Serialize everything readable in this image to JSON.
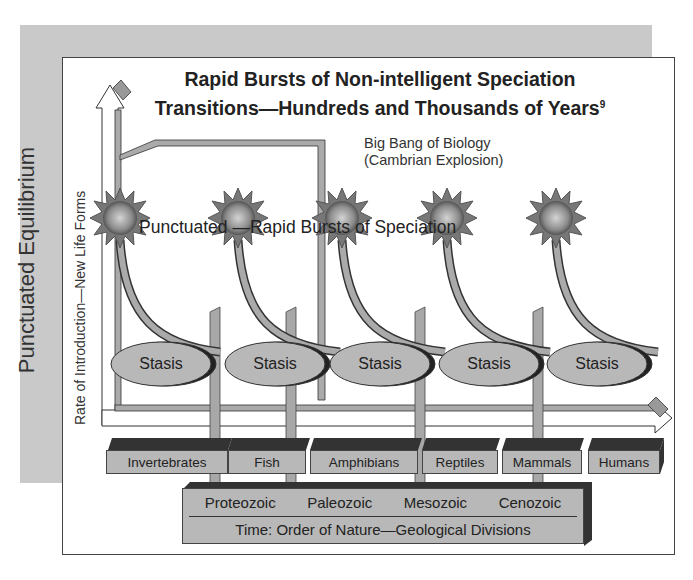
{
  "diagram": {
    "side_label": "Punctuated Equilibrium",
    "title_line1": "Rapid Bursts of Non-intelligent Speciation",
    "title_line2": "Transitions—Hundreds and Thousands of Years",
    "title_footnote": "9",
    "y_axis_label": "Rate of Introduction—New Life Forms",
    "bigbang_line1": "Big Bang of Biology",
    "bigbang_line2": "(Cambrian Explosion)",
    "burst_label": "Punctuated —Rapid Bursts of Speciation",
    "stasis": [
      "Stasis",
      "Stasis",
      "Stasis",
      "Stasis",
      "Stasis"
    ],
    "groups": [
      "Invertebrates",
      "Fish",
      "Amphibians",
      "Reptiles",
      "Mammals",
      "Humans"
    ],
    "eras": [
      "Proteozoic",
      "Paleozoic",
      "Mesozoic",
      "Cenozoic"
    ],
    "eras_caption": "Time: Order of Nature—Geological Divisions",
    "colors": {
      "band": "#c9c9c9",
      "fill_gray": "#b8b8b8",
      "dark_shadow": "#2a2a2a",
      "burst": "#8a8a8a"
    }
  }
}
